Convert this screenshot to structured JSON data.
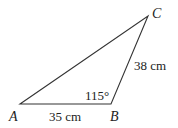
{
  "diagram": {
    "type": "triangle",
    "vertices": [
      {
        "name": "A",
        "x": 20,
        "y": 104
      },
      {
        "name": "B",
        "x": 111,
        "y": 104
      },
      {
        "name": "C",
        "x": 148,
        "y": 16
      }
    ],
    "labels": {
      "A": "A",
      "B": "B",
      "C": "C",
      "side_AB": "35 cm",
      "side_BC": "38 cm",
      "angle_B": "115°"
    },
    "colors": {
      "stroke": "#333333",
      "text": "#222222",
      "background": "#ffffff"
    }
  }
}
